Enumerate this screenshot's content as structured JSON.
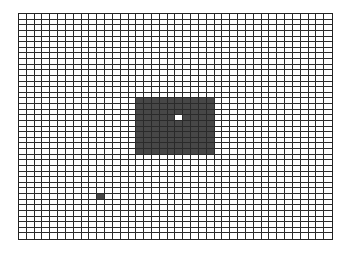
{
  "grid": {
    "cols": 40,
    "rows": 40,
    "colors": {
      "background": "#ffffff",
      "filled": "#474747",
      "line": "#2a2a2a",
      "highlight": "#ffffff"
    },
    "filled_regions": [
      {
        "name": "large-block",
        "col_start": 15,
        "col_end": 24,
        "row_start": 15,
        "row_end": 24
      },
      {
        "name": "small-block",
        "col_start": 10,
        "col_end": 10,
        "row_start": 32,
        "row_end": 32
      }
    ],
    "highlight_cells": [
      {
        "name": "cursor-cell",
        "col": 20,
        "row": 18
      }
    ]
  }
}
